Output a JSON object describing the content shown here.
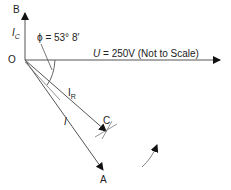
{
  "diagram": {
    "type": "phasor-diagram",
    "labels": {
      "B": "B",
      "O": "O",
      "Ic_main": "I",
      "Ic_sub": "C",
      "phi": "ϕ = 53° 8′",
      "U_main": "U",
      "U_rest": " = 250V (Not to Scale)",
      "IR_main": "I",
      "IR_sub": "R",
      "I": "I",
      "C": "C",
      "A": "A"
    },
    "phasors": [
      {
        "name": "U",
        "value": "250V",
        "direction": "horizontal",
        "note": "Not to Scale"
      },
      {
        "name": "I_C",
        "direction": "vertical",
        "endpoint": "B"
      },
      {
        "name": "I_R",
        "endpoint": "C"
      },
      {
        "name": "I",
        "endpoint": "A"
      }
    ],
    "angle": {
      "symbol": "ϕ",
      "value": "53° 8′"
    },
    "colors": {
      "line": "#555555",
      "text": "#222222",
      "arrow": "#111111"
    }
  }
}
